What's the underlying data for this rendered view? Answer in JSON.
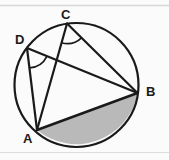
{
  "figure": {
    "background_color": "#fbfbfb",
    "stroke_color": "#1a1a1a",
    "shaded_color": "#b9b9b9",
    "scan_line_color": "#d8d8d8",
    "circle": {
      "cx": 76.5,
      "cy": 85,
      "r": 62
    },
    "points": [
      {
        "id": "A",
        "x": 37,
        "y": 130,
        "label": "A"
      },
      {
        "id": "B",
        "x": 137.5,
        "y": 93,
        "label": "B"
      },
      {
        "id": "C",
        "x": 67,
        "y": 23.5,
        "label": "C"
      },
      {
        "id": "D",
        "x": 27,
        "y": 48,
        "label": "D"
      }
    ],
    "chords": [
      {
        "name": "chord-CA",
        "from": "C",
        "to": "A"
      },
      {
        "name": "chord-CB",
        "from": "C",
        "to": "B"
      },
      {
        "name": "chord-DA",
        "from": "D",
        "to": "A"
      },
      {
        "name": "chord-DB",
        "from": "D",
        "to": "B"
      },
      {
        "name": "chord-AB",
        "from": "A",
        "to": "B"
      }
    ],
    "angle_marks": [
      {
        "name": "angle-arc-at-C",
        "vertex": "C",
        "radius": 20
      },
      {
        "name": "angle-arc-at-D",
        "vertex": "D",
        "radius": 20
      }
    ],
    "shaded_region": {
      "name": "circle-segment-below-AB",
      "description": "minor segment bounded by chord AB and the arc from A to B"
    }
  },
  "labels": {
    "A": "A",
    "B": "B",
    "C": "C",
    "D": "D"
  }
}
